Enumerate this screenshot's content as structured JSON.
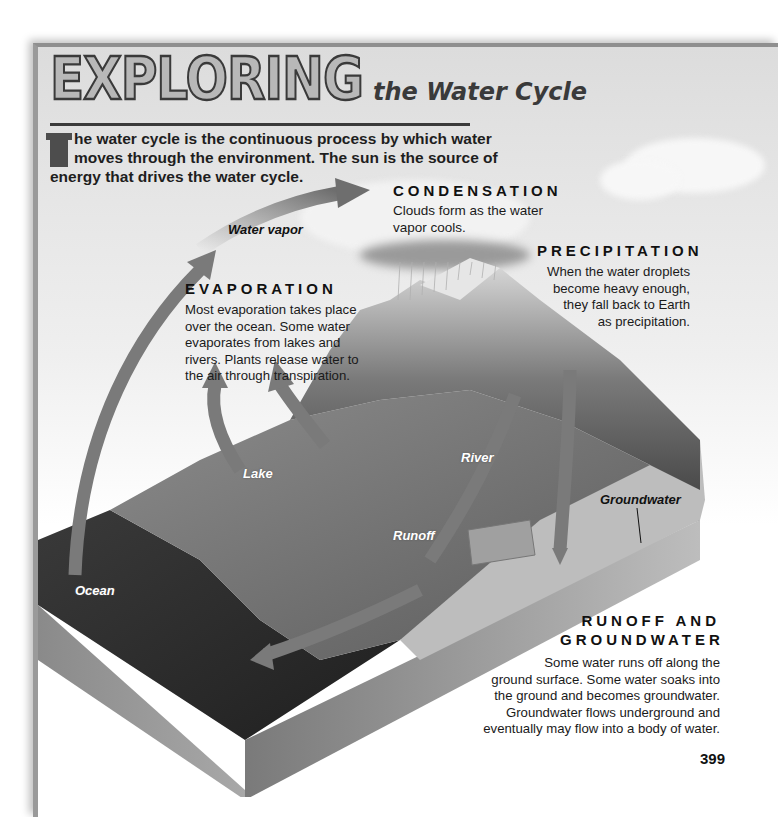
{
  "header": {
    "title_main": "EXPLORING",
    "title_sub": "the Water Cycle"
  },
  "intro": {
    "drop_cap": "T",
    "text": "he water cycle is the continuous process by which water moves through the environment. The sun is the source of energy that drives the water cycle."
  },
  "sections": {
    "condensation": {
      "heading": "CONDENSATION",
      "body": "Clouds form as the water vapor cools."
    },
    "precipitation": {
      "heading": "PRECIPITATION",
      "body_lines": [
        "When the water droplets",
        "become heavy enough,",
        "they fall back to Earth",
        "as precipitation."
      ]
    },
    "evaporation": {
      "heading": "EVAPORATION",
      "body_lines": [
        "Most evaporation takes place",
        "over the ocean. Some water",
        "evaporates from lakes and",
        "rivers. Plants release water to",
        "the air through transpiration."
      ]
    },
    "runoff_groundwater": {
      "heading_lines": [
        "RUNOFF AND",
        "GROUNDWATER"
      ],
      "body_lines": [
        "Some water runs off along the",
        "ground surface. Some water soaks into",
        "the ground and becomes groundwater.",
        "Groundwater flows underground and",
        "eventually may flow into a body of water."
      ]
    }
  },
  "diagram_labels": {
    "water_vapor": "Water vapor",
    "lake": "Lake",
    "river": "River",
    "runoff": "Runoff",
    "groundwater": "Groundwater",
    "ocean": "Ocean"
  },
  "colors": {
    "arrow": "#7a7a7a",
    "ocean": "#2f2f2f",
    "land": "#6b6b6b",
    "mountain": "#8a8a8a",
    "soil": "#bdbdbd"
  },
  "page_number": "399"
}
